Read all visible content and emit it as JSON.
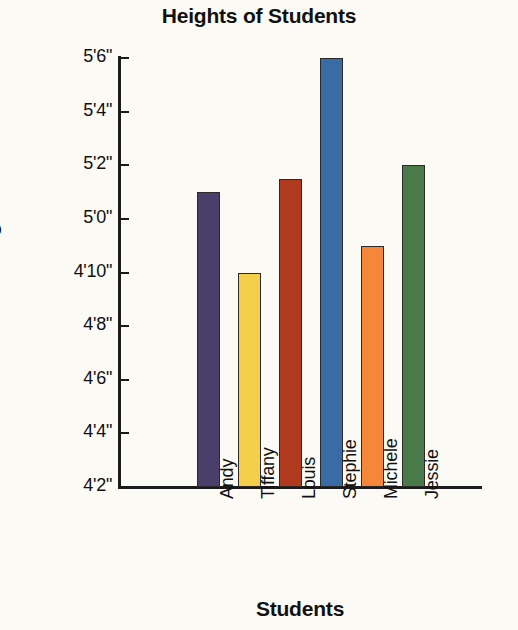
{
  "chart_data": {
    "type": "bar",
    "title": "Heights of Students",
    "xlabel": "Students",
    "ylabel": "Heights",
    "categories": [
      "Andy",
      "Tiffany",
      "Louis",
      "Stephie",
      "Michele",
      "Jessie"
    ],
    "values": [
      61,
      58,
      61.5,
      66,
      59,
      62
    ],
    "value_labels": [
      "5'1\"",
      "4'10\"",
      "5'1.5\"",
      "5'6\"",
      "4'11\"",
      "5'2\""
    ],
    "unit": "inches",
    "ylim": [
      50,
      66
    ],
    "ylim_labels": [
      "4'2\"",
      "5'6\""
    ],
    "ytick_values": [
      66,
      64,
      62,
      60,
      58,
      56,
      54,
      52,
      50
    ],
    "ytick_labels": [
      "5'6\"",
      "5'4\"",
      "5'2\"",
      "5'0\"",
      "4'10\"",
      "4'8\"",
      "4'6\"",
      "4'4\"",
      "4'2\""
    ],
    "grid": false,
    "legend": false,
    "bar_colors": [
      "#4a3f6b",
      "#f5cf4a",
      "#b03a1e",
      "#3a6ba5",
      "#f5873a",
      "#4a7a4a"
    ],
    "series": [
      {
        "name": "Heights",
        "values": [
          61,
          58,
          61.5,
          66,
          59,
          62
        ]
      }
    ]
  },
  "chart": {
    "title": "Heights of Students",
    "y_axis_title": "Heights",
    "x_axis_title": "Students",
    "background_color": "#fbfaf5",
    "axis_color": "#1b1b1b"
  }
}
